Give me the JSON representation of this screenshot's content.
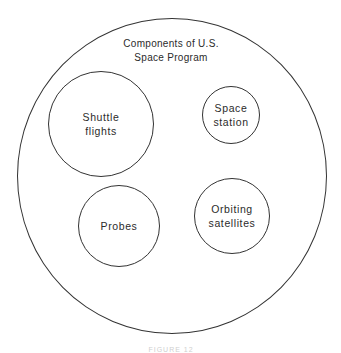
{
  "diagram": {
    "type": "venn-containment",
    "outer": {
      "title_line1": "Components of U.S.",
      "title_line2": "Space Program",
      "cx": 172,
      "cy": 176,
      "rx": 155,
      "ry": 158
    },
    "inner_sets": [
      {
        "id": "shuttle",
        "line1": "Shuttle",
        "line2": "flights",
        "cx": 101,
        "cy": 124,
        "r": 53
      },
      {
        "id": "station",
        "line1": "Space",
        "line2": "station",
        "cx": 231,
        "cy": 115,
        "r": 29
      },
      {
        "id": "probes",
        "line1": "Probes",
        "line2": "",
        "cx": 119,
        "cy": 226,
        "r": 41
      },
      {
        "id": "satellites",
        "line1": "Orbiting",
        "line2": "satellites",
        "cx": 232,
        "cy": 216,
        "r": 38
      }
    ],
    "caption": "FIGURE 12"
  },
  "colors": {
    "stroke": "#333333",
    "text": "#2b2b2b",
    "background": "#ffffff"
  }
}
